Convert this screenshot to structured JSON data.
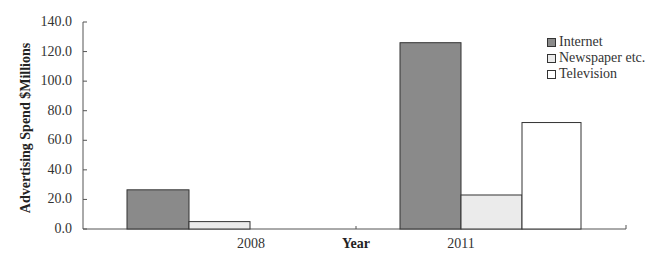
{
  "chart_data": {
    "type": "bar",
    "title": "",
    "xlabel": "Year",
    "ylabel": "Advertising Spend  $Millions",
    "categories": [
      "2008",
      "2011"
    ],
    "series": [
      {
        "name": "Internet",
        "values": [
          26.5,
          126.0
        ],
        "color": "#8a8a8a"
      },
      {
        "name": "Newspaper etc.",
        "values": [
          5.0,
          23.0
        ],
        "color": "#ebebeb"
      },
      {
        "name": "Television",
        "values": [
          0.0,
          72.0
        ],
        "color": "#ffffff"
      }
    ],
    "ylim": [
      0,
      140
    ],
    "yticks": [
      "0.0",
      "20.0",
      "40.0",
      "60.0",
      "80.0",
      "100.0",
      "120.0",
      "140.0"
    ],
    "grid": false,
    "legend_position": "top-right"
  },
  "legend": {
    "items": [
      {
        "label": "Internet"
      },
      {
        "label": "Newspaper etc."
      },
      {
        "label": "Television"
      }
    ]
  }
}
